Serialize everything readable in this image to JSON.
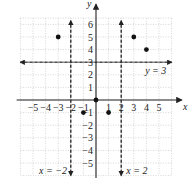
{
  "chart_data": {
    "type": "scatter",
    "title": "",
    "xlabel": "x",
    "ylabel": "y",
    "xlim": [
      -6,
      6
    ],
    "ylim": [
      -6,
      6.5
    ],
    "grid": true,
    "x_ticks": [
      -5,
      -4,
      -3,
      -2,
      -1,
      1,
      2,
      3,
      4,
      5
    ],
    "y_ticks": [
      6,
      5,
      4,
      3,
      2,
      1,
      -1,
      -2,
      -3,
      -4,
      -5
    ],
    "points": [
      {
        "x": -3,
        "y": 5
      },
      {
        "x": 3,
        "y": 5
      },
      {
        "x": 4,
        "y": 4
      },
      {
        "x": 0,
        "y": 0
      },
      {
        "x": -1,
        "y": -1
      },
      {
        "x": 1,
        "y": -1
      }
    ],
    "lines": [
      {
        "label": "y = 3",
        "type": "horizontal",
        "value": 3,
        "style": "dashed"
      },
      {
        "label": "x = -2",
        "type": "vertical",
        "value": -2,
        "style": "dashed"
      },
      {
        "label": "x = 2",
        "type": "vertical",
        "value": 2,
        "style": "dashed"
      }
    ]
  },
  "labels": {
    "x_axis": "x",
    "y_axis": "y",
    "line_y3": "y = 3",
    "line_xm2": "x = −2",
    "line_x2": "x = 2",
    "x_ticks": [
      "−5",
      "−4",
      "−3",
      "−2",
      "−1",
      "1",
      "2",
      "3",
      "4",
      "5"
    ],
    "y_ticks": [
      "6",
      "5",
      "4",
      "3",
      "2",
      "1",
      "−1",
      "−2",
      "−3",
      "−4",
      "−5"
    ]
  }
}
